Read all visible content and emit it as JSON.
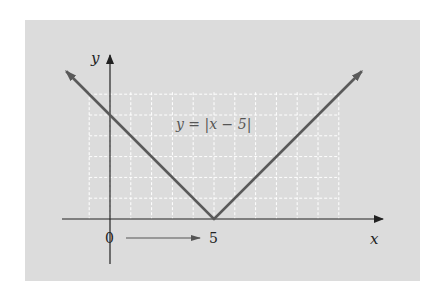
{
  "chart_data": {
    "type": "line",
    "title": "",
    "equation_label": "y = |x − 5|",
    "xlabel": "x",
    "ylabel": "y",
    "tick_labels": {
      "origin": "0",
      "vertex_x": "5"
    },
    "annotation": "horizontal shift arrow from 0 to 5",
    "series": [
      {
        "name": "y = |x − 5|",
        "x": [
          -2.1,
          5,
          12.1
        ],
        "y": [
          7.1,
          0,
          7.1
        ]
      }
    ],
    "xlim": [
      -2.1,
      13.2
    ],
    "ylim": [
      -2.1,
      7.9
    ],
    "grid": {
      "on": true,
      "x_range": [
        -1,
        11
      ],
      "y_range": [
        0,
        6
      ],
      "style": "dashed white"
    },
    "colors": {
      "line": "#5a5a5a",
      "axes": "#222222",
      "panel": "#dcdcdc",
      "grid": "#ffffff"
    }
  }
}
